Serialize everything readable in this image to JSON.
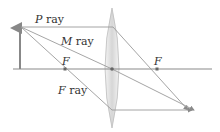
{
  "diagram": {
    "type": "ray-diagram-converging-lens",
    "labels": {
      "p_ray_letter": "P",
      "p_ray_word": " ray",
      "m_ray_letter": "M",
      "m_ray_word": " ray",
      "f_ray_letter": "F",
      "f_ray_word": " ray",
      "focal_left": "F",
      "focal_right": "F"
    },
    "colors": {
      "axis": "#8a8a8a",
      "ray": "#9a9a9a",
      "object_arrow": "#888888",
      "lens_edge": "#bdbdbd",
      "focal_point": "#666666",
      "text": "#333333"
    },
    "elements": {
      "object": "upright arrow left of lens",
      "lens": "biconvex lens",
      "rays": [
        "P ray",
        "M ray",
        "F ray"
      ],
      "focal_points": [
        "F (left)",
        "F (right)"
      ]
    }
  }
}
